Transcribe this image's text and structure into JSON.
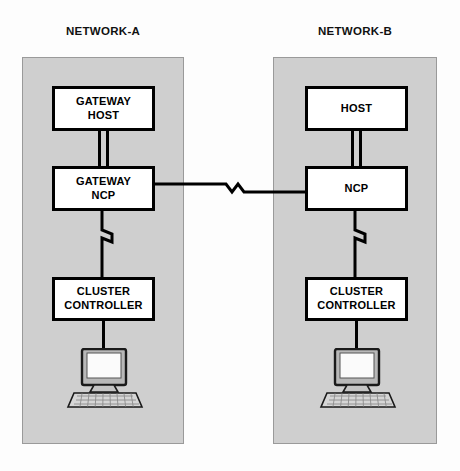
{
  "diagram": {
    "colors": {
      "panel_fill": "#cfcfcf",
      "panel_border": "#9a9a9a",
      "node_fill": "#ffffff",
      "node_border": "#000000",
      "line": "#000000",
      "page_background": "#fdfdfd"
    },
    "networks": [
      {
        "id": "network-a",
        "title": "NETWORK-A",
        "nodes": [
          {
            "id": "a-host",
            "label_lines": [
              "GATEWAY",
              "HOST"
            ]
          },
          {
            "id": "a-ncp",
            "label_lines": [
              "GATEWAY",
              "NCP"
            ]
          },
          {
            "id": "a-cluster",
            "label_lines": [
              "CLUSTER",
              "CONTROLLER"
            ]
          }
        ],
        "terminal": {
          "id": "a-terminal",
          "icon": "computer-terminal-icon"
        }
      },
      {
        "id": "network-b",
        "title": "NETWORK-B",
        "nodes": [
          {
            "id": "b-host",
            "label_lines": [
              "HOST"
            ]
          },
          {
            "id": "b-ncp",
            "label_lines": [
              "NCP"
            ]
          },
          {
            "id": "b-cluster",
            "label_lines": [
              "CLUSTER",
              "CONTROLLER"
            ]
          }
        ],
        "terminal": {
          "id": "b-terminal",
          "icon": "computer-terminal-icon"
        }
      }
    ],
    "connections": [
      {
        "id": "a-host-to-ncp",
        "from": "a-host",
        "to": "a-ncp",
        "style": "double-line"
      },
      {
        "id": "b-host-to-ncp",
        "from": "b-host",
        "to": "b-ncp",
        "style": "double-line"
      },
      {
        "id": "a-ncp-to-cluster",
        "from": "a-ncp",
        "to": "a-cluster",
        "style": "zigzag-line"
      },
      {
        "id": "b-ncp-to-cluster",
        "from": "b-ncp",
        "to": "b-cluster",
        "style": "zigzag-line"
      },
      {
        "id": "a-cluster-to-term",
        "from": "a-cluster",
        "to": "a-terminal",
        "style": "single-line"
      },
      {
        "id": "b-cluster-to-term",
        "from": "b-cluster",
        "to": "b-terminal",
        "style": "single-line"
      },
      {
        "id": "a-ncp-to-b-ncp",
        "from": "a-ncp",
        "to": "b-ncp",
        "style": "zigzag-line"
      }
    ]
  }
}
